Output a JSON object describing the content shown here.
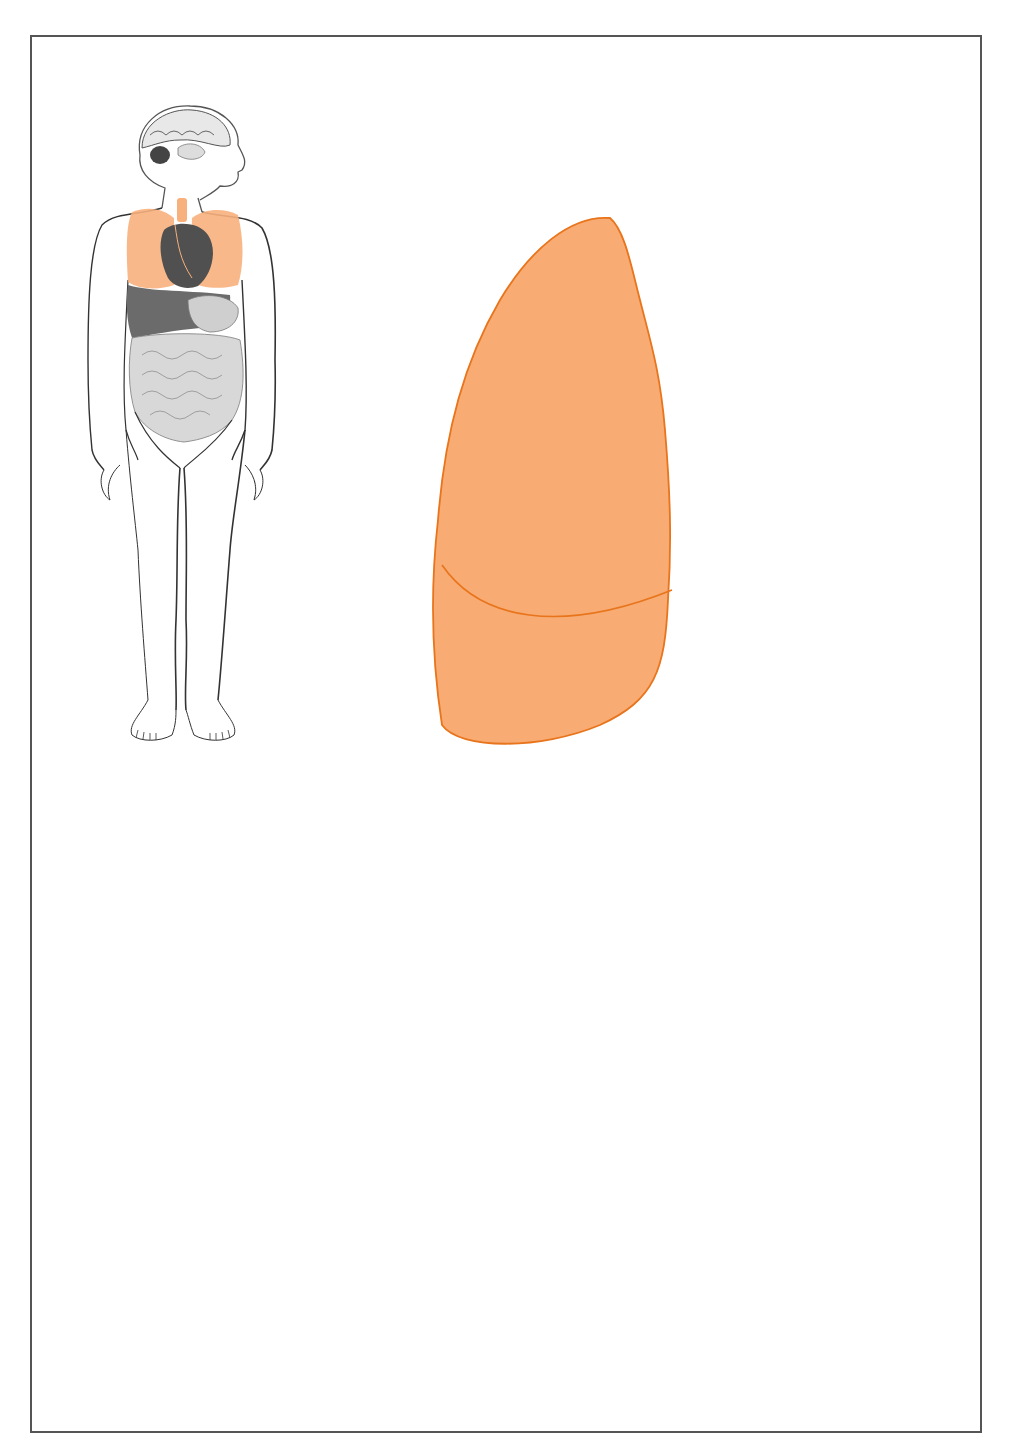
{
  "page": {
    "title_fragment": "",
    "colors": {
      "accent_orange": "#f07d1e",
      "lung_fill": "#f8a86a",
      "lung_fill_dark": "#f5934a",
      "lung_outline": "#e8741c",
      "airway_gray": "#c8c8c8",
      "hair_gray": "#8c8c8c",
      "skin_light": "#eef0f0",
      "shirt_gray": "#cfd2d2",
      "frame_border": "#555555"
    }
  },
  "figures": [
    {
      "id": "body",
      "description": "Full-body anatomical figure showing brain, lungs (orange), heart and digestive organs"
    },
    {
      "id": "lungs",
      "description": "Lungs with trachea, larynx and bronchial tree, lobes outlined in orange"
    },
    {
      "id": "inhaler",
      "description": "Profile of a person using a metered-dose inhaler"
    }
  ]
}
